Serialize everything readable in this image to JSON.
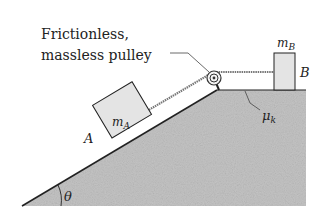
{
  "diagram": {
    "pulley_label_line1": "Frictionless,",
    "pulley_label_line2": "massless pulley",
    "block_a": {
      "mass_symbol": "m",
      "mass_subscript": "A",
      "label": "A"
    },
    "block_b": {
      "mass_symbol": "m",
      "mass_subscript": "B",
      "label": "B"
    },
    "friction": {
      "symbol": "μ",
      "subscript": "k"
    },
    "angle": {
      "symbol": "θ"
    },
    "colors": {
      "ground_fill": "#c4c4c4",
      "block_fill": "#e4e4e4",
      "outline": "#222222",
      "rope": "#777777"
    }
  }
}
